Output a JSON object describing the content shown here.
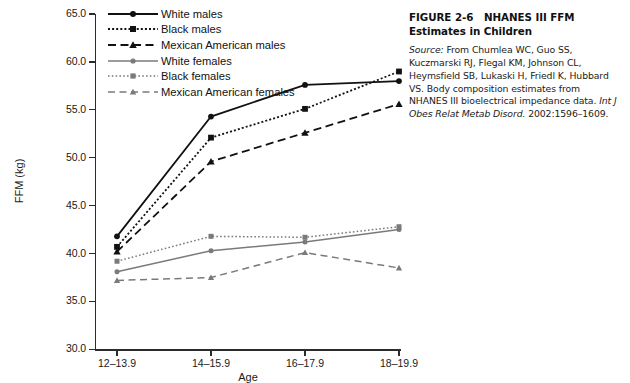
{
  "caption": {
    "figure_number": "FIGURE 2-6",
    "title": "NHANES III FFM Estimates in Children",
    "source_label": "Source:",
    "source_text": "From Chumlea WC, Guo SS, Kuczmarski RJ, Flegal KM, Johnson CL, Heymsfield SB, Lukaski H, Friedl K, Hubbard VS. Body composition estimates from NHANES III bioelectrical impedance data.",
    "journal": "Int J Obes Relat Metab Disord.",
    "citation_tail": "2002:1596–1609."
  },
  "chart_data": {
    "type": "line",
    "title": "",
    "xlabel": "Age",
    "ylabel": "FFM (kg)",
    "categories": [
      "12–13.9",
      "14–15.9",
      "16–17.9",
      "18–19.9"
    ],
    "ylim": [
      30.0,
      65.0
    ],
    "yticks": [
      "30.0",
      "35.0",
      "40.0",
      "45.0",
      "50.0",
      "55.0",
      "60.0",
      "65.0"
    ],
    "ytick_values": [
      30.0,
      35.0,
      40.0,
      45.0,
      50.0,
      55.0,
      60.0,
      65.0
    ],
    "grid": false,
    "legend_position": "top-left-inside",
    "series": [
      {
        "name": "White males",
        "values": [
          41.8,
          54.3,
          57.6,
          58.0
        ],
        "color": "#111111",
        "dash": "none",
        "marker": "circle"
      },
      {
        "name": "Black males",
        "values": [
          40.7,
          52.1,
          55.1,
          59.0
        ],
        "color": "#111111",
        "dash": "dotted",
        "marker": "square"
      },
      {
        "name": "Mexican American males",
        "values": [
          40.2,
          49.6,
          52.6,
          55.6
        ],
        "color": "#111111",
        "dash": "dashed",
        "marker": "triangle"
      },
      {
        "name": "White females",
        "values": [
          38.1,
          40.3,
          41.2,
          42.5
        ],
        "color": "#7a7a7a",
        "dash": "none",
        "marker": "circle"
      },
      {
        "name": "Black females",
        "values": [
          39.2,
          41.8,
          41.7,
          42.8
        ],
        "color": "#7a7a7a",
        "dash": "dotted",
        "marker": "square"
      },
      {
        "name": "Mexican American females",
        "values": [
          37.2,
          37.5,
          40.1,
          38.5
        ],
        "color": "#7a7a7a",
        "dash": "dashed",
        "marker": "triangle"
      }
    ]
  }
}
